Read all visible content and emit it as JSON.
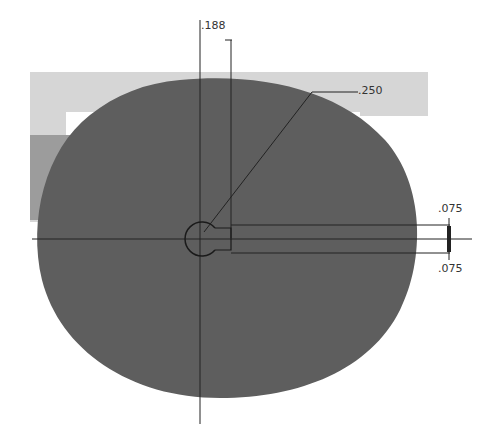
{
  "drawing": {
    "type": "cam-profile",
    "colors": {
      "background": "#ffffff",
      "cam_fill": "#5f5f5f",
      "bg_light": "#d4d4d4",
      "bg_mid": "#9a9a9a",
      "line": "#2a2a2a"
    },
    "dimensions": {
      "top": ".188",
      "hub_radius": ".250",
      "slot_upper": ".075",
      "slot_lower": ".075"
    }
  }
}
